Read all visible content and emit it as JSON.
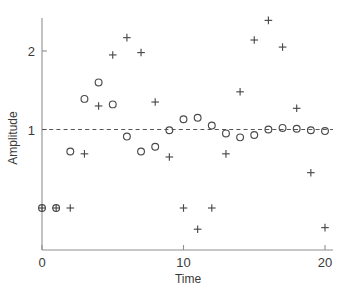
{
  "chart_data": {
    "type": "scatter",
    "title": "",
    "xlabel": "Time",
    "ylabel": "Amplitude",
    "xlim": [
      -0.6,
      20.8
    ],
    "ylim": [
      -0.55,
      2.62
    ],
    "xticks": [
      0,
      10,
      20
    ],
    "xtick_labels": [
      "0",
      "10",
      "20"
    ],
    "yticks": [
      1,
      2
    ],
    "ytick_labels": [
      "1",
      "2"
    ],
    "grid": false,
    "legend": null,
    "reference_line": {
      "type": "horizontal",
      "y": 1,
      "style": "dashed",
      "color": "#555555"
    },
    "series": [
      {
        "name": "circles",
        "marker": "o",
        "color": "#4a4a4a",
        "points": [
          {
            "x": 0,
            "y": 0.0
          },
          {
            "x": 1,
            "y": 0.0
          },
          {
            "x": 2,
            "y": 0.72
          },
          {
            "x": 3,
            "y": 1.39
          },
          {
            "x": 4,
            "y": 1.6
          },
          {
            "x": 5,
            "y": 1.32
          },
          {
            "x": 6,
            "y": 0.91
          },
          {
            "x": 7,
            "y": 0.72
          },
          {
            "x": 8,
            "y": 0.78
          },
          {
            "x": 9,
            "y": 0.99
          },
          {
            "x": 10,
            "y": 1.13
          },
          {
            "x": 11,
            "y": 1.15
          },
          {
            "x": 12,
            "y": 1.05
          },
          {
            "x": 13,
            "y": 0.95
          },
          {
            "x": 14,
            "y": 0.9
          },
          {
            "x": 15,
            "y": 0.93
          },
          {
            "x": 16,
            "y": 1.0
          },
          {
            "x": 17,
            "y": 1.02
          },
          {
            "x": 18,
            "y": 1.01
          },
          {
            "x": 19,
            "y": 0.99
          },
          {
            "x": 20,
            "y": 0.98
          }
        ]
      },
      {
        "name": "crosses",
        "marker": "+",
        "color": "#4a4a4a",
        "points": [
          {
            "x": 0,
            "y": 0.0
          },
          {
            "x": 1,
            "y": 0.0
          },
          {
            "x": 2,
            "y": 0.0
          },
          {
            "x": 3,
            "y": 0.69
          },
          {
            "x": 4,
            "y": 1.3
          },
          {
            "x": 5,
            "y": 1.95
          },
          {
            "x": 6,
            "y": 2.17
          },
          {
            "x": 7,
            "y": 1.98
          },
          {
            "x": 8,
            "y": 1.35
          },
          {
            "x": 9,
            "y": 0.65
          },
          {
            "x": 10,
            "y": 0.0
          },
          {
            "x": 11,
            "y": -0.27
          },
          {
            "x": 12,
            "y": 0.0
          },
          {
            "x": 13,
            "y": 0.69
          },
          {
            "x": 14,
            "y": 1.48
          },
          {
            "x": 15,
            "y": 2.14
          },
          {
            "x": 16,
            "y": 2.39
          },
          {
            "x": 17,
            "y": 2.05
          },
          {
            "x": 18,
            "y": 1.27
          },
          {
            "x": 19,
            "y": 0.45
          },
          {
            "x": 20,
            "y": -0.25
          }
        ]
      }
    ]
  },
  "figure": {
    "background_color": "#ffffff",
    "axis_color": "#808080",
    "marker_color": "#4a4a4a"
  }
}
